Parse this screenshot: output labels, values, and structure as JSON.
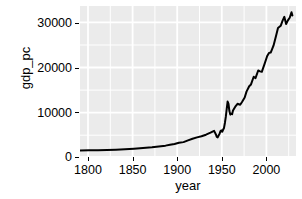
{
  "chart_data": {
    "type": "line",
    "title": "",
    "xlabel": "year",
    "ylabel": "gdp_pc",
    "xlim": [
      1780,
      2020
    ],
    "ylim": [
      0,
      33500
    ],
    "grid": true,
    "legend": null,
    "x_ticks": [
      1800,
      1850,
      1900,
      1950,
      2000
    ],
    "y_ticks": [
      0,
      10000,
      20000,
      30000
    ],
    "x_tick_labels": [
      "1800",
      "1850",
      "1900",
      "1950",
      "2000"
    ],
    "y_tick_labels": [
      "0",
      "10000",
      "20000",
      "30000"
    ],
    "line_color": "#000000",
    "panel_color": "#ebebeb",
    "grid_color": "#ffffff",
    "series": [
      {
        "name": "gdp_pc",
        "x": [
          1780,
          1790,
          1800,
          1810,
          1820,
          1830,
          1840,
          1850,
          1860,
          1870,
          1875,
          1880,
          1885,
          1890,
          1895,
          1900,
          1905,
          1910,
          1915,
          1920,
          1925,
          1929,
          1930,
          1931,
          1932,
          1933,
          1934,
          1935,
          1936,
          1937,
          1938,
          1939,
          1940,
          1941,
          1942,
          1943,
          1944,
          1945,
          1946,
          1947,
          1948,
          1949,
          1950,
          1953,
          1955,
          1958,
          1960,
          1963,
          1965,
          1968,
          1970,
          1973,
          1975,
          1978,
          1980,
          1982,
          1985,
          1988,
          1990,
          1992,
          1995,
          1998,
          2000,
          2003,
          2005,
          2007,
          2009,
          2011,
          2013,
          2015,
          2016
        ],
        "y": [
          1450,
          1480,
          1520,
          1560,
          1620,
          1700,
          1820,
          1980,
          2150,
          2400,
          2520,
          2720,
          2900,
          3180,
          3300,
          3700,
          4050,
          4350,
          4600,
          4950,
          5400,
          5800,
          5400,
          5000,
          4450,
          4350,
          4750,
          5100,
          5700,
          5900,
          5600,
          6050,
          6450,
          7550,
          8900,
          10600,
          12300,
          11800,
          10200,
          9400,
          9600,
          9500,
          10300,
          11300,
          11800,
          11600,
          12200,
          13200,
          14500,
          15700,
          16100,
          17800,
          17500,
          19200,
          19000,
          18900,
          20600,
          22400,
          23100,
          23200,
          24700,
          27000,
          28600,
          29100,
          30200,
          31100,
          29500,
          30300,
          30900,
          32100,
          31400
        ]
      }
    ]
  },
  "axes": {
    "y_title": "gdp_pc",
    "x_title": "year"
  }
}
